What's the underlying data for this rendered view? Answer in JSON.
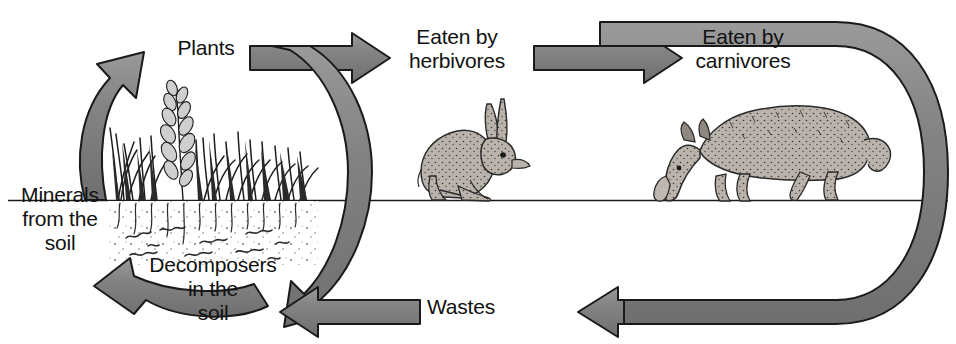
{
  "figure": {
    "type": "cycle-diagram",
    "topic": "Ecosystem nutrient cycle / food chain",
    "background_color": "#ffffff",
    "arrow_fill_color": "#808080",
    "arrow_stroke_color": "#1a1a1a",
    "text_color": "#111111",
    "ground_line_color": "#1a1a1a"
  },
  "labels": {
    "plants": "Plants",
    "eaten_by_herbivores": "Eaten by\nherbivores",
    "eaten_by_carnivores": "Eaten by\ncarnivores",
    "minerals_from_the_soil": "Minerals\nfrom the\nsoil",
    "decomposers_in_the_soil": "Decomposers\nin the\nsoil",
    "wastes": "Wastes"
  },
  "illustrations": [
    {
      "name": "grass-plants",
      "caption": "Plants"
    },
    {
      "name": "rabbit",
      "caption": "Eaten by herbivores"
    },
    {
      "name": "wolf",
      "caption": "Eaten by carnivores"
    },
    {
      "name": "soil-decomposers",
      "caption": "Decomposers in the soil"
    }
  ],
  "flow": {
    "nodes": [
      "Plants",
      "Eaten by herbivores",
      "Eaten by carnivores",
      "Wastes",
      "Decomposers in the soil",
      "Minerals from the soil"
    ],
    "connections": [
      {
        "from": "Plants",
        "to": "Eaten by herbivores",
        "direction": "right"
      },
      {
        "from": "Eaten by herbivores",
        "to": "Eaten by carnivores",
        "direction": "right"
      },
      {
        "from": "Eaten by carnivores",
        "to": "Wastes",
        "direction": "down-left"
      },
      {
        "from": "Eaten by herbivores",
        "to": "Wastes",
        "direction": "down-left"
      },
      {
        "from": "Wastes",
        "to": "Decomposers in the soil",
        "direction": "left"
      },
      {
        "from": "Decomposers in the soil",
        "to": "Minerals from the soil",
        "direction": "up-left"
      },
      {
        "from": "Minerals from the soil",
        "to": "Plants",
        "direction": "up-right"
      }
    ]
  }
}
